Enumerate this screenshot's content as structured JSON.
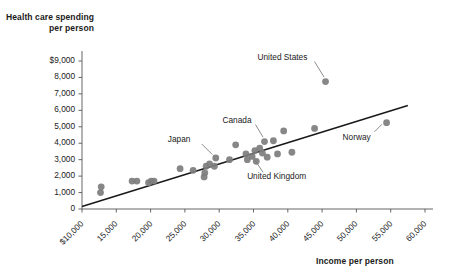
{
  "chart_data": {
    "type": "scatter",
    "title": "",
    "xlabel": "Income per person",
    "ylabel": "Health care spending per person",
    "xlim": [
      10000,
      60000
    ],
    "ylim": [
      0,
      9000
    ],
    "grid": false,
    "legend": null,
    "xticks": [
      "$10,000",
      "15,000",
      "20,000",
      "25,000",
      "30,000",
      "35,000",
      "40,000",
      "45,000",
      "50,000",
      "55,000",
      "60,000"
    ],
    "xtick_values": [
      10000,
      15000,
      20000,
      25000,
      30000,
      35000,
      40000,
      45000,
      50000,
      55000,
      60000
    ],
    "yticks": [
      "0",
      "1,000",
      "2,000",
      "3,000",
      "4,000",
      "5,000",
      "6,000",
      "7,000",
      "8,000",
      "$9,000"
    ],
    "ytick_values": [
      0,
      1000,
      2000,
      3000,
      4000,
      5000,
      6000,
      7000,
      8000,
      9000
    ],
    "point_color": "#7d7d7d",
    "line_color": "#1a1a1a",
    "trendline": {
      "x": [
        10000,
        57500
      ],
      "y": [
        150,
        6300
      ]
    },
    "points": [
      {
        "x": 12700,
        "y": 1000,
        "label": null
      },
      {
        "x": 12800,
        "y": 1350,
        "label": null
      },
      {
        "x": 17300,
        "y": 1700,
        "label": null
      },
      {
        "x": 18000,
        "y": 1700,
        "label": null
      },
      {
        "x": 19700,
        "y": 1600,
        "label": null
      },
      {
        "x": 20100,
        "y": 1700,
        "label": null
      },
      {
        "x": 20500,
        "y": 1700,
        "label": null
      },
      {
        "x": 24300,
        "y": 2450,
        "label": null
      },
      {
        "x": 26200,
        "y": 2350,
        "label": null
      },
      {
        "x": 27800,
        "y": 1950,
        "label": null
      },
      {
        "x": 27900,
        "y": 2200,
        "label": null
      },
      {
        "x": 28100,
        "y": 2600,
        "label": null
      },
      {
        "x": 28600,
        "y": 2750,
        "label": null
      },
      {
        "x": 29300,
        "y": 2600,
        "label": null
      },
      {
        "x": 29500,
        "y": 3100,
        "label": "Japan"
      },
      {
        "x": 31500,
        "y": 3000,
        "label": null
      },
      {
        "x": 32400,
        "y": 3900,
        "label": null
      },
      {
        "x": 33900,
        "y": 3350,
        "label": null
      },
      {
        "x": 34100,
        "y": 3000,
        "label": null
      },
      {
        "x": 34800,
        "y": 3200,
        "label": "United Kingdom"
      },
      {
        "x": 35200,
        "y": 3550,
        "label": null
      },
      {
        "x": 35400,
        "y": 2900,
        "label": null
      },
      {
        "x": 35900,
        "y": 3700,
        "label": null
      },
      {
        "x": 36300,
        "y": 3400,
        "label": null
      },
      {
        "x": 36600,
        "y": 4100,
        "label": "Canada"
      },
      {
        "x": 37000,
        "y": 3150,
        "label": null
      },
      {
        "x": 37900,
        "y": 4150,
        "label": null
      },
      {
        "x": 38500,
        "y": 3350,
        "label": null
      },
      {
        "x": 39400,
        "y": 4750,
        "label": null
      },
      {
        "x": 40600,
        "y": 3450,
        "label": null
      },
      {
        "x": 43900,
        "y": 4900,
        "label": null
      },
      {
        "x": 45500,
        "y": 7750,
        "label": "United States"
      },
      {
        "x": 54400,
        "y": 5250,
        "label": "Norway"
      }
    ],
    "annotations": [
      {
        "text": "United States",
        "target_x": 45500,
        "target_y": 7750,
        "anchor": "above-left"
      },
      {
        "text": "Norway",
        "target_x": 54400,
        "target_y": 5250,
        "anchor": "below-left"
      },
      {
        "text": "Canada",
        "target_x": 36600,
        "target_y": 4100,
        "anchor": "above-left"
      },
      {
        "text": "Japan",
        "target_x": 29500,
        "target_y": 3100,
        "anchor": "above-left"
      },
      {
        "text": "United Kingdom",
        "target_x": 34800,
        "target_y": 3200,
        "anchor": "below-right"
      }
    ]
  }
}
